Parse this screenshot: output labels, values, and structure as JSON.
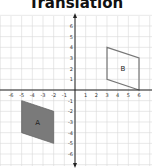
{
  "title": "Translation",
  "colors": {
    "grid": "#d9d9d9",
    "axis": "#222222",
    "shape_a_fill": "#7a7a7a",
    "shape_a_stroke": "#666666",
    "shape_b_stroke": "#777777"
  },
  "axes": {
    "x_ticks": [
      "-6",
      "-5",
      "-4",
      "-3",
      "-2",
      "-1",
      "1",
      "2",
      "3",
      "4",
      "5",
      "6"
    ],
    "y_ticks": [
      "6",
      "5",
      "4",
      "3",
      "2",
      "1",
      "-1",
      "-2",
      "-3",
      "-4",
      "-5",
      "-6"
    ]
  },
  "shapes": {
    "a": {
      "label": "A",
      "vertices": [
        [
          -5,
          -1
        ],
        [
          -2,
          -2
        ],
        [
          -2,
          -5
        ],
        [
          -5,
          -4
        ]
      ],
      "filled": true
    },
    "b": {
      "label": "B",
      "vertices": [
        [
          3,
          4
        ],
        [
          6,
          3
        ],
        [
          6,
          0
        ],
        [
          3,
          1
        ]
      ],
      "filled": false
    }
  }
}
